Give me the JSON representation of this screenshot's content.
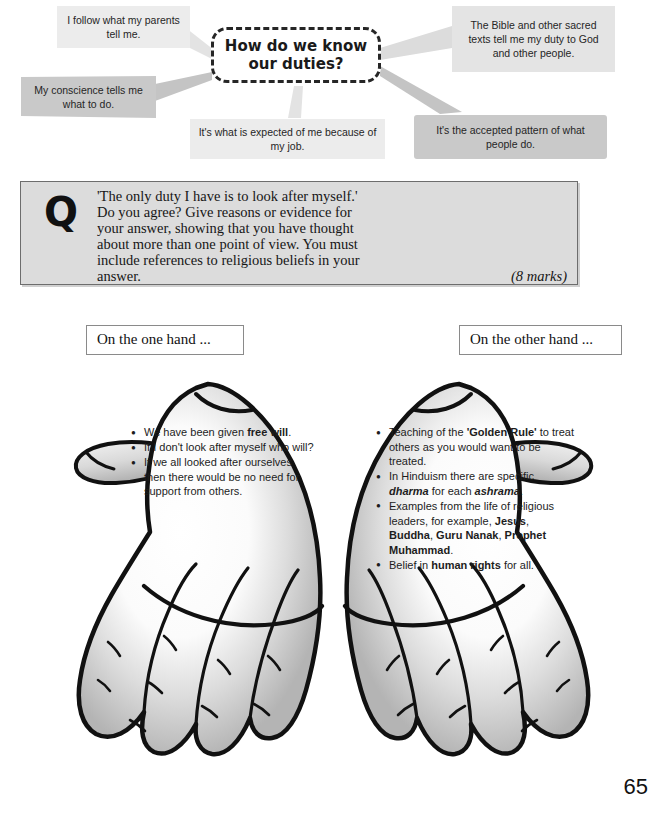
{
  "concept_map": {
    "central_question": "How do we know our duties?",
    "bubbles": [
      {
        "id": "parents",
        "text": "I follow what my parents tell me.",
        "color": "#ececec"
      },
      {
        "id": "conscience",
        "text": "My conscience tells me what to do.",
        "color": "#c9c9c9"
      },
      {
        "id": "job",
        "text": "It's what is expected of me because of my job.",
        "color": "#ececec"
      },
      {
        "id": "bible",
        "text": "The Bible and other sacred texts tell me my duty to God and other people.",
        "color": "#e4e4e4"
      },
      {
        "id": "pattern",
        "text": "It's the accepted pattern of what people do.",
        "color": "#c9c9c9"
      }
    ]
  },
  "exam_question": {
    "icon_letter": "Q",
    "line1": "'The only duty I have is to look after myself.'",
    "line2": "Do you agree? Give reasons or evidence for",
    "line3": "your answer, showing that you have thought",
    "line4": "about more than one point of view. You must",
    "line5": "include references to religious beliefs in your",
    "line6": "answer.",
    "marks": "(8 marks)"
  },
  "hands": {
    "left": {
      "label": "On the one hand ...",
      "bullets": [
        {
          "html": "We have been given <b>free will</b>."
        },
        {
          "html": "If I don't look after myself who will?"
        },
        {
          "html": "If we all looked after ourselves then there would be no need for support from others."
        }
      ]
    },
    "right": {
      "label": "On the other hand ...",
      "bullets": [
        {
          "html": "Teaching of the <b>'Golden Rule'</b> to treat others as you would want to be treated."
        },
        {
          "html": "In Hinduism there are specific <i>dharma</i> for each <i>ashrama</i>."
        },
        {
          "html": "Examples from the life of religious leaders, for example, <b>Jesus</b>, <b>Buddha</b>, <b>Guru Nanak</b>, <b>Prophet Muhammad</b>."
        },
        {
          "html": "Belief in <b>human rights</b> for all."
        }
      ]
    }
  },
  "page_number": "65",
  "colors": {
    "outline": "#111111",
    "question_box_fill": "#dcdcdc",
    "question_box_border": "#6d6d6d",
    "palm_light": "#ffffff",
    "palm_mid": "#d2d2d2",
    "palm_shadow": "#9d9d9d"
  }
}
